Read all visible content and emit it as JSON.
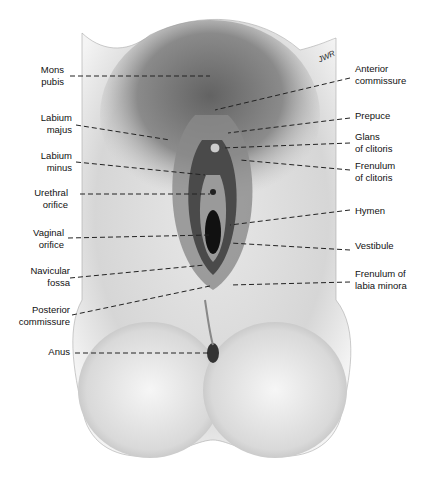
{
  "figure": {
    "type": "anatomical-illustration",
    "signature": "JWR",
    "labels_left": [
      {
        "id": "mons-pubis",
        "text": "Mons\npubis",
        "x": 66,
        "y": 69,
        "line_to": [
          210,
          76
        ]
      },
      {
        "id": "labium-majus",
        "text": "Labium\nmajus",
        "x": 66,
        "y": 115,
        "line_to": [
          170,
          140
        ]
      },
      {
        "id": "labium-minus",
        "text": "Labium\nminus",
        "x": 66,
        "y": 153,
        "line_to": [
          205,
          175
        ]
      },
      {
        "id": "urethral-orifice",
        "text": "Urethral\norifice",
        "x": 66,
        "y": 190,
        "line_to": [
          210,
          194
        ]
      },
      {
        "id": "vaginal-orifice",
        "text": "Vaginal\norifice",
        "x": 66,
        "y": 230,
        "line_to": [
          210,
          235
        ]
      },
      {
        "id": "navicular-fossa",
        "text": "Navicular\nfossa",
        "x": 66,
        "y": 266,
        "line_to": [
          205,
          265
        ]
      },
      {
        "id": "posterior-commissure",
        "text": "Posterior\ncommissure",
        "x": 66,
        "y": 307,
        "line_to": [
          210,
          286
        ]
      },
      {
        "id": "anus",
        "text": "Anus",
        "x": 66,
        "y": 346,
        "line_to": [
          210,
          353
        ]
      }
    ],
    "labels_right": [
      {
        "id": "anterior-commissure",
        "text": "Anterior\ncommissure",
        "x": 355,
        "y": 64,
        "line_to": [
          215,
          110
        ]
      },
      {
        "id": "prepuce",
        "text": "Prepuce",
        "x": 355,
        "y": 111,
        "line_to": [
          228,
          133
        ]
      },
      {
        "id": "glans-of-clitoris",
        "text": "Glans\nof clitoris",
        "x": 355,
        "y": 132,
        "line_to": [
          222,
          148
        ]
      },
      {
        "id": "frenulum-of-clitoris",
        "text": "Frenulum\nof clitoris",
        "x": 355,
        "y": 161,
        "line_to": [
          240,
          160
        ]
      },
      {
        "id": "hymen",
        "text": "Hymen",
        "x": 355,
        "y": 205,
        "line_to": [
          230,
          225
        ]
      },
      {
        "id": "vestibule",
        "text": "Vestibule",
        "x": 355,
        "y": 239,
        "line_to": [
          230,
          243
        ]
      },
      {
        "id": "frenulum-of-labia-minora",
        "text": "Frenulum of\nlabia minora",
        "x": 355,
        "y": 268,
        "line_to": [
          230,
          285
        ]
      }
    ]
  }
}
